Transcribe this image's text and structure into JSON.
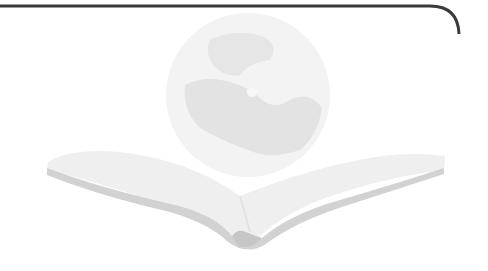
{
  "illustration": {
    "subject": "globe-over-open-book",
    "globe_icon": "globe-icon",
    "book_icon": "open-book-icon",
    "colors": {
      "frame_line": "#3a3a3a",
      "globe_fill": "#f1f1f1",
      "globe_land": "#e4e4e4",
      "book_page": "#f0f0f0",
      "book_edge": "#cfcfcf",
      "book_spine": "#c4c4c4",
      "background": "#ffffff"
    }
  },
  "caption": ""
}
